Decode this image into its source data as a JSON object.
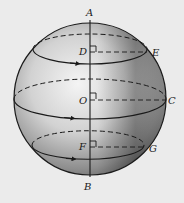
{
  "diagram": {
    "type": "sphere-with-parallel-circles",
    "colors": {
      "background": "#ebebeb",
      "line": "#1a1a1a",
      "shade_dark": "#5a5a5a",
      "shade_light": "#f2f2f2"
    },
    "points": {
      "A": "A",
      "B": "B",
      "C": "C",
      "D": "D",
      "E": "E",
      "F": "F",
      "G": "G",
      "O": "O"
    },
    "circles": [
      {
        "name": "upper-circle",
        "center": "D",
        "edge_point": "E"
      },
      {
        "name": "great-circle-equator",
        "center": "O",
        "edge_point": "C"
      },
      {
        "name": "lower-circle",
        "center": "F",
        "edge_point": "G"
      }
    ],
    "axis": {
      "from": "A",
      "to": "B"
    }
  }
}
